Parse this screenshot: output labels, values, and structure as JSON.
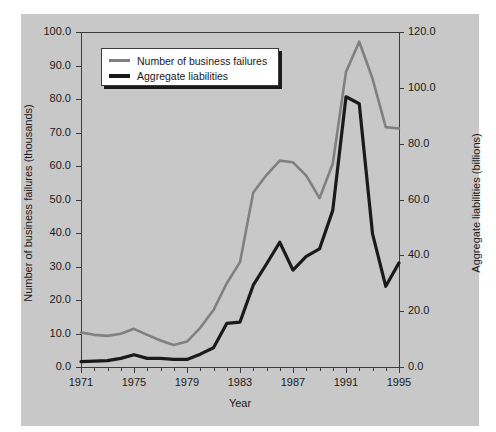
{
  "chart_data": {
    "type": "line",
    "title": "",
    "xlabel": "Year",
    "ylabel": "Number of business failures (thousands)",
    "ylabel_right": "Aggregate liabilities (billions)",
    "x": [
      1971,
      1972,
      1973,
      1974,
      1975,
      1976,
      1977,
      1978,
      1979,
      1980,
      1981,
      1982,
      1983,
      1984,
      1985,
      1986,
      1987,
      1988,
      1989,
      1990,
      1991,
      1992,
      1993,
      1994,
      1995
    ],
    "xlim": [
      1971,
      1995
    ],
    "xticks": [
      1971,
      1975,
      1979,
      1983,
      1987,
      1991,
      1995
    ],
    "xticklabels": [
      "1971",
      "1975",
      "1979",
      "1983",
      "1987",
      "1991",
      "1995"
    ],
    "xminorticks": [
      1972,
      1973,
      1974,
      1976,
      1977,
      1978,
      1980,
      1981,
      1982,
      1984,
      1985,
      1986,
      1988,
      1989,
      1990,
      1992,
      1993,
      1994
    ],
    "ylim": [
      0.0,
      100.0
    ],
    "yticks": [
      0.0,
      10.0,
      20.0,
      30.0,
      40.0,
      50.0,
      60.0,
      70.0,
      80.0,
      90.0,
      100.0
    ],
    "yticklabels": [
      "0.0",
      "10.0",
      "20.0",
      "30.0",
      "40.0",
      "50.0",
      "60.0",
      "70.0",
      "80.0",
      "90.0",
      "100.0"
    ],
    "ylim_right": [
      0.0,
      120.0
    ],
    "yticks_right": [
      0.0,
      20.0,
      40.0,
      60.0,
      80.0,
      100.0,
      120.0
    ],
    "yticklabels_right": [
      "0.0",
      "20.0",
      "40.0",
      "60.0",
      "80.0",
      "100.0",
      "120.0"
    ],
    "grid": false,
    "legend_position": "upper left",
    "series": [
      {
        "name": "Number of business failures",
        "axis": "left",
        "units": "thousands",
        "color": "#808080",
        "values": [
          10.3,
          9.6,
          9.3,
          9.9,
          11.4,
          9.6,
          7.9,
          6.6,
          7.6,
          11.7,
          17.0,
          25.0,
          31.3,
          52.1,
          57.3,
          61.6,
          61.1,
          57.1,
          50.4,
          60.7,
          88.1,
          97.1,
          86.1,
          71.6,
          71.2
        ]
      },
      {
        "name": "Aggregate liabilities",
        "axis": "right",
        "units": "billions",
        "color": "#1a1a1a",
        "values": [
          1.9,
          2.1,
          2.3,
          3.1,
          4.4,
          3.1,
          3.1,
          2.7,
          2.7,
          4.6,
          6.9,
          15.6,
          16.1,
          29.3,
          36.9,
          44.7,
          34.7,
          39.6,
          42.3,
          56.1,
          96.8,
          94.3,
          47.8,
          28.9,
          37.3
        ]
      }
    ]
  },
  "legend": {
    "items": [
      {
        "label": "Number of business failures",
        "color": "#808080"
      },
      {
        "label": "Aggregate liabilities",
        "color": "#1a1a1a"
      }
    ]
  }
}
